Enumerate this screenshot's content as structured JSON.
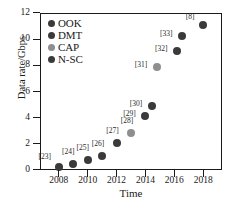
{
  "chart_data": {
    "type": "scatter",
    "title": "",
    "xlabel": "Time",
    "ylabel": "Data rate/Gbps",
    "xlim": [
      2006.7,
      2019.3
    ],
    "ylim": [
      0,
      12
    ],
    "xticks": [
      2008,
      2010,
      2012,
      2014,
      2016,
      2018
    ],
    "yticks": [
      0,
      2,
      4,
      6,
      8,
      10,
      12
    ],
    "grid": false,
    "legend_position": "upper left",
    "legend": [
      "OOK",
      "DMT",
      "CAP",
      "N-SC"
    ],
    "series": [
      {
        "name": "OOK",
        "color": "#3a3a3a",
        "points": [
          {
            "label": "[23]",
            "x": 2008.0,
            "y": 0.25
          },
          {
            "label": "[24]",
            "x": 2009.0,
            "y": 0.45
          },
          {
            "label": "[25]",
            "x": 2010.0,
            "y": 0.8
          }
        ]
      },
      {
        "name": "DMT",
        "color": "#3a3a3a",
        "points": [
          {
            "label": "[26]",
            "x": 2011.0,
            "y": 1.1
          },
          {
            "label": "[27]",
            "x": 2012.0,
            "y": 2.1
          },
          {
            "label": "[29]",
            "x": 2014.0,
            "y": 4.15
          },
          {
            "label": "[30]",
            "x": 2014.45,
            "y": 4.9
          },
          {
            "label": "[32]",
            "x": 2016.2,
            "y": 9.1
          },
          {
            "label": "[33]",
            "x": 2016.55,
            "y": 10.25
          },
          {
            "label": "[8]",
            "x": 2018.0,
            "y": 11.05
          }
        ]
      },
      {
        "name": "CAP",
        "color": "#8e8e8e",
        "points": [
          {
            "label": "[28]",
            "x": 2013.0,
            "y": 2.85
          },
          {
            "label": "[31]",
            "x": 2014.8,
            "y": 7.85
          }
        ]
      },
      {
        "name": "N-SC",
        "color": "#3a3a3a",
        "points": []
      }
    ],
    "annotations": [
      {
        "text": "[23]",
        "x": 2008.0,
        "y": 0.25,
        "dx": -14,
        "dy": -10
      },
      {
        "text": "[24]",
        "x": 2009.0,
        "y": 0.45,
        "dx": -5,
        "dy": -12
      },
      {
        "text": "[25]",
        "x": 2010.0,
        "y": 0.8,
        "dx": -5,
        "dy": -12
      },
      {
        "text": "[26]",
        "x": 2011.0,
        "y": 1.1,
        "dx": -4,
        "dy": -12
      },
      {
        "text": "[27]",
        "x": 2012.0,
        "y": 2.1,
        "dx": -4,
        "dy": -12
      },
      {
        "text": "[28]",
        "x": 2013.0,
        "y": 2.85,
        "dx": -4,
        "dy": -12
      },
      {
        "text": "[29]",
        "x": 2014.0,
        "y": 4.15,
        "dx": -16,
        "dy": -2
      },
      {
        "text": "[30]",
        "x": 2014.45,
        "y": 4.9,
        "dx": -16,
        "dy": -2
      },
      {
        "text": "[31]",
        "x": 2014.8,
        "y": 7.85,
        "dx": -16,
        "dy": -2
      },
      {
        "text": "[32]",
        "x": 2016.2,
        "y": 9.1,
        "dx": -16,
        "dy": -2
      },
      {
        "text": "[33]",
        "x": 2016.55,
        "y": 10.25,
        "dx": -16,
        "dy": -2
      },
      {
        "text": "[8]",
        "x": 2018.0,
        "y": 11.05,
        "dx": -13,
        "dy": -8
      }
    ]
  },
  "colors": {
    "axis": "#1a1a1a",
    "text": "#1a1a1a",
    "marker_dark": "#3a3a3a",
    "marker_light": "#8e8e8e",
    "background": "#ffffff"
  }
}
